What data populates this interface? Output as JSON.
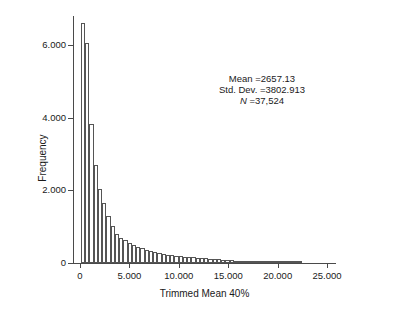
{
  "chart_data": {
    "type": "bar",
    "title": "",
    "xlabel": "Trimmed Mean 40%",
    "ylabel": "Frequency",
    "xlim": [
      -700,
      25800
    ],
    "ylim": [
      0,
      6800
    ],
    "grid": false,
    "legend": null,
    "bin_width": 430,
    "x_ticks": [
      {
        "value": 0,
        "label": "0"
      },
      {
        "value": 5000,
        "label": "5.000"
      },
      {
        "value": 10000,
        "label": "10.000"
      },
      {
        "value": 15000,
        "label": "15.000"
      },
      {
        "value": 20000,
        "label": "20.000"
      },
      {
        "value": 25000,
        "label": "25.000"
      }
    ],
    "y_ticks": [
      {
        "value": 0,
        "label": "0"
      },
      {
        "value": 2000,
        "label": "2.000"
      },
      {
        "value": 4000,
        "label": "4.000"
      },
      {
        "value": 6000,
        "label": "6.000"
      }
    ],
    "bin_centers": [
      215,
      645,
      1075,
      1505,
      1935,
      2365,
      2795,
      3225,
      3655,
      4085,
      4515,
      4945,
      5375,
      5805,
      6235,
      6665,
      7095,
      7525,
      7955,
      8385,
      8815,
      9245,
      9675,
      10105,
      10535,
      10965,
      11395,
      11825,
      12255,
      12685,
      13115,
      13545,
      13975,
      14405,
      14835,
      15265,
      15695,
      16125,
      16555,
      16985,
      17415,
      17845,
      18275,
      18705,
      19135,
      19565,
      19995,
      20425,
      20855,
      21285,
      21715,
      22145
    ],
    "values": [
      6600,
      6050,
      3820,
      2700,
      2030,
      1660,
      1290,
      1020,
      790,
      700,
      640,
      560,
      500,
      450,
      400,
      360,
      330,
      300,
      275,
      250,
      230,
      215,
      200,
      185,
      175,
      165,
      155,
      145,
      135,
      125,
      115,
      105,
      98,
      90,
      82,
      75,
      68,
      60,
      54,
      48,
      42,
      36,
      30,
      26,
      22,
      18,
      15,
      13,
      11,
      9,
      7,
      5
    ],
    "annotation": {
      "mean_label": "Mean =2657.13",
      "sd_label": "Std. Dev. =3802.913",
      "n_prefix": "N",
      "n_label": " =37,524",
      "mean": 2657.13,
      "std_dev": 3802.913,
      "n": 37524
    },
    "colors": {
      "bar_fill": "#ffffff",
      "bar_edge": "#555555",
      "axis": "#4a4a4a",
      "text": "#1a1a1a",
      "background": "#ffffff"
    }
  }
}
